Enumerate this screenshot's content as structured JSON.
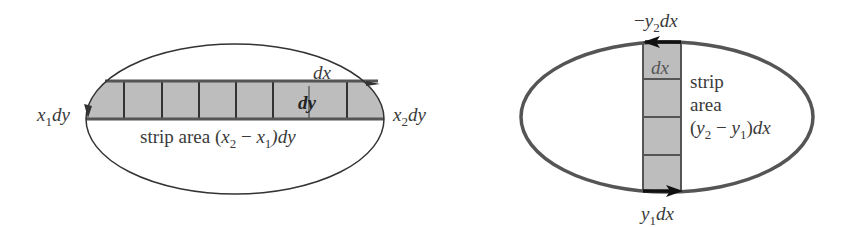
{
  "left_figure": {
    "description": "Horizontal strip of width dy across ellipse, divided into dx cells",
    "label_x1": {
      "var": "x",
      "sub": "1",
      "suffix": "dy"
    },
    "label_x2": {
      "var": "x",
      "sub": "2",
      "suffix": "dy"
    },
    "label_dx": "dx",
    "label_dy": "dy",
    "strip_area": {
      "prefix": "strip area (",
      "v1": "x",
      "s1": "2",
      "minus": " − ",
      "v2": "x",
      "s2": "1",
      "suffix": ")dy"
    },
    "cell_count": 7
  },
  "right_figure": {
    "description": "Vertical strip of width dx across ellipse, divided into dy cells",
    "label_top": {
      "prefix": "−",
      "var": "y",
      "sub": "2",
      "suffix": "dx"
    },
    "label_bottom": {
      "var": "y",
      "sub": "1",
      "suffix": "dx"
    },
    "label_dx": "dx",
    "strip_line1": "strip",
    "strip_line2": "area",
    "strip_area": {
      "v1": "y",
      "s1": "2",
      "minus": " − ",
      "v2": "y",
      "s2": "1",
      "suffix": "dx"
    },
    "cell_count": 4
  },
  "colors": {
    "strip_fill": "#bdbdbd",
    "outline": "#555555",
    "text": "#3a3a3a"
  }
}
